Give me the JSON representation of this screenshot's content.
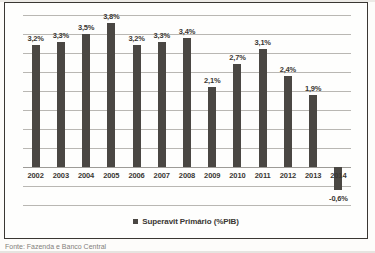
{
  "chart_data": {
    "type": "bar",
    "title": "",
    "subtitle": "",
    "xlabel": "",
    "ylabel": "",
    "categories": [
      "2002",
      "2003",
      "2004",
      "2005",
      "2006",
      "2007",
      "2008",
      "2009",
      "2010",
      "2011",
      "2012",
      "2013",
      "2014"
    ],
    "values": [
      3.2,
      3.3,
      3.5,
      3.8,
      3.2,
      3.3,
      3.4,
      2.1,
      2.7,
      3.1,
      2.4,
      1.9,
      -0.6
    ],
    "value_labels": [
      "3,2%",
      "3,3%",
      "3,5%",
      "3,8%",
      "3,2%",
      "3,3%",
      "3,4%",
      "2,1%",
      "2,7%",
      "3,1%",
      "2,4%",
      "1,9%",
      "-0,6%"
    ],
    "series": [
      {
        "name": "Superavit Primário  (%PIB)",
        "values": [
          3.2,
          3.3,
          3.5,
          3.8,
          3.2,
          3.3,
          3.4,
          2.1,
          2.7,
          3.1,
          2.4,
          1.9,
          -0.6
        ]
      }
    ],
    "ylim": [
      -1.0,
      4.0
    ],
    "ytick_step": 0.5,
    "gridlines": true,
    "grid_values": [
      4.0,
      3.5,
      3.0,
      2.5,
      2.0,
      1.5,
      1.0,
      0.5,
      0.0,
      -0.5,
      -1.0
    ],
    "legend_position": "bottom",
    "bar_color": "#4a4743",
    "grid_color": "#b9b7b3",
    "axis_color": "#9d9b97"
  },
  "legend": {
    "swatch_icon": "filled-square-icon",
    "label": "Superavit Primário  (%PIB)"
  },
  "footer": {
    "source_note": "Fonte: Fazenda e Banco Central"
  }
}
